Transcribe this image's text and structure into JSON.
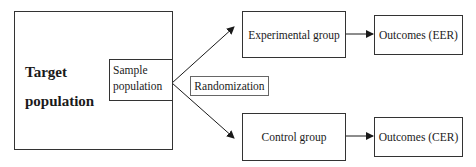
{
  "diagram": {
    "target_population": {
      "line1": "Target",
      "line2": "population"
    },
    "sample_population": {
      "line1": "Sample",
      "line2": "population"
    },
    "randomization": "Randomization",
    "experimental_group": "Experimental group",
    "control_group": "Control group",
    "outcomes_eer": "Outcomes (EER)",
    "outcomes_cer": "Outcomes (CER)"
  },
  "colors": {
    "line": "#1a1a1a",
    "box_border": "#333333",
    "background": "#ffffff"
  }
}
